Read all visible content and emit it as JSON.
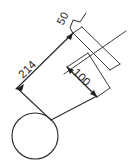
{
  "drawing": {
    "title": "Dimensioned sketch with circle",
    "type": "technical-line-drawing",
    "background_color": "#ffffff",
    "line_color": "#2b2b2b",
    "text_color": "#1c1c1c",
    "dimensions": [
      {
        "id": "length",
        "label": "214",
        "orientation": "diagonal-up-right",
        "rotation_deg": -45,
        "text_x": 30,
        "text_y": 72
      },
      {
        "id": "width",
        "label": "100",
        "orientation": "diagonal-down-right",
        "rotation_deg": 45,
        "text_x": 74,
        "text_y": 76
      },
      {
        "id": "offset",
        "label": "50",
        "orientation": "leader-callout",
        "rotation_deg": -60,
        "text_x": 64,
        "text_y": 18
      }
    ],
    "shapes": [
      {
        "id": "circle",
        "kind": "circle",
        "cx": 35,
        "cy": 136,
        "r": 23
      }
    ]
  }
}
